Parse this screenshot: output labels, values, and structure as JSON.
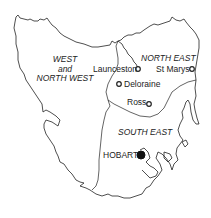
{
  "map": {
    "title": "Tasmania regions",
    "regions": [
      {
        "id": "west",
        "lines": [
          "WEST",
          "and",
          "NORTH WEST"
        ]
      },
      {
        "id": "north_east",
        "label": "NORTH EAST"
      },
      {
        "id": "south_east",
        "label": "SOUTH EAST"
      }
    ],
    "towns": [
      {
        "name": "Launceston",
        "marker": "open-circle"
      },
      {
        "name": "St Marys",
        "marker": "open-circle"
      },
      {
        "name": "Deloraine",
        "marker": "open-circle"
      },
      {
        "name": "Ross",
        "marker": "open-circle"
      },
      {
        "name": "HOBART",
        "marker": "filled-circle"
      }
    ],
    "colors": {
      "line": "#222222",
      "background": "#ffffff"
    }
  }
}
